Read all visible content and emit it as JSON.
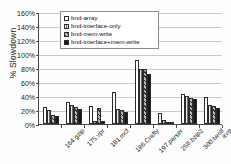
{
  "chart_data": {
    "type": "bar",
    "title": "",
    "xlabel": "",
    "ylabel": "% Slowdown",
    "ylim": [
      0,
      160
    ],
    "ytick_labels": [
      "0%",
      "20%",
      "40%",
      "60%",
      "80%",
      "100%",
      "120%",
      "140%",
      "160%"
    ],
    "ytick_values": [
      0,
      20,
      40,
      60,
      80,
      100,
      120,
      140,
      160
    ],
    "grid": true,
    "legend_position": "upper-center",
    "categories": [
      "164.gzip",
      "175.vpr",
      "181.mcf",
      "186.Crafty",
      "197.parser",
      "256.bzip2",
      "300.twolf",
      "avg"
    ],
    "series": [
      {
        "name": "bnd-array",
        "values": [
          25,
          31,
          26,
          46,
          92,
          16,
          43,
          39
        ]
      },
      {
        "name": "bnd-interface-only",
        "values": [
          20,
          27,
          5,
          22,
          79,
          6,
          40,
          27
        ]
      },
      {
        "name": "bnd-mem-write",
        "values": [
          13,
          24,
          23,
          20,
          79,
          2,
          37,
          26
        ]
      },
      {
        "name": "bnd-interface+mem-write",
        "values": [
          11,
          21,
          5,
          17,
          72,
          2,
          36,
          23
        ]
      }
    ]
  },
  "legend": {
    "items": [
      {
        "label": "bnd-array",
        "swatch": "white-square-icon"
      },
      {
        "label": "bnd-interface-only",
        "swatch": "dark-vertical-hatch-square-icon"
      },
      {
        "label": "bnd-mem-write",
        "swatch": "gray-diagonal-hatch-square-icon"
      },
      {
        "label": "bnd-interface+mem-write",
        "swatch": "black-square-icon"
      }
    ]
  },
  "colors": {
    "series_0": "#ffffff",
    "series_1": "#6d6d6d",
    "series_2": "#b9b9b9",
    "series_3": "#171717",
    "axis": "#4a4a4a",
    "gridline": "#c9c9c9",
    "text": "#1a1a1a"
  }
}
